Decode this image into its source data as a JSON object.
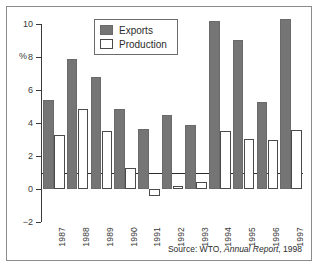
{
  "chart_data": {
    "type": "bar",
    "title": "",
    "subtitle": "",
    "xlabel": "",
    "ylabel": "%",
    "ylim": [
      -2,
      10
    ],
    "yticks": [
      -2,
      0,
      2,
      4,
      6,
      8,
      10
    ],
    "ytick_labels": [
      "−2",
      "0",
      "2",
      "4",
      "6",
      "8",
      "10"
    ],
    "grid": false,
    "legend_position": "top-center",
    "categories": [
      "1987",
      "1988",
      "1989",
      "1990",
      "1991",
      "1992",
      "1993",
      "1994",
      "1995",
      "1996",
      "1997"
    ],
    "series": [
      {
        "name": "Exports",
        "color": "#757575",
        "values": [
          5.4,
          7.9,
          6.8,
          4.85,
          3.65,
          4.5,
          3.85,
          10.2,
          9.05,
          5.25,
          10.3
        ]
      },
      {
        "name": "Production",
        "color": "#ffffff",
        "values": [
          3.25,
          4.85,
          3.5,
          1.25,
          -0.4,
          0.2,
          0.4,
          3.5,
          3.05,
          2.95,
          3.6
        ]
      }
    ],
    "annotations": [
      "Source: WTO, Annual Report, 1998"
    ]
  },
  "legend": {
    "items": [
      {
        "label": "Exports"
      },
      {
        "label": "Production"
      }
    ]
  },
  "source": {
    "prefix": "Source: WTO, ",
    "italic": "Annual Report",
    "suffix": ", 1998"
  }
}
